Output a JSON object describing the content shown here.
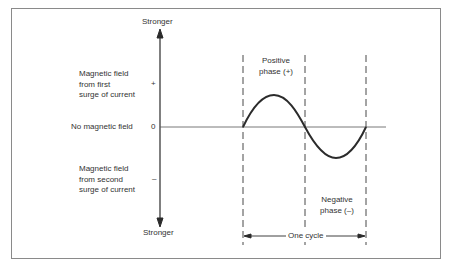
{
  "diagram": {
    "axis": {
      "top_label": "Stronger",
      "bottom_label": "Stronger",
      "tick_plus": "+",
      "tick_zero": "0",
      "tick_minus": "–"
    },
    "left_labels": {
      "positive": "Magnetic field\nfrom first\nsurge of current",
      "zero": "No magnetic field",
      "negative": "Magnetic field\nfrom second\nsurge of current"
    },
    "phase_labels": {
      "positive": "Positive\nphase (+)",
      "negative": "Negative\nphase (–)"
    },
    "cycle_label": "One cycle",
    "colors": {
      "line": "#2b2b2b",
      "frame": "#8a8a8a",
      "background": "#ffffff"
    }
  }
}
